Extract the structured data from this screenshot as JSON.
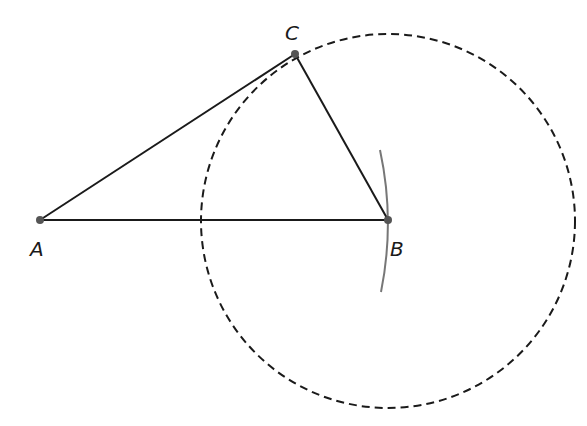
{
  "diagram": {
    "type": "geometric-construction",
    "points": [
      {
        "id": "A",
        "label": "A",
        "x": 40,
        "y": 220,
        "label_x": 30,
        "label_y": 255
      },
      {
        "id": "B",
        "label": "B",
        "x": 388,
        "y": 220,
        "label_x": 390,
        "label_y": 255
      },
      {
        "id": "C",
        "label": "C",
        "x": 295,
        "y": 54,
        "label_x": 285,
        "label_y": 40
      }
    ],
    "segments": [
      {
        "from": "A",
        "to": "B"
      },
      {
        "from": "A",
        "to": "C"
      },
      {
        "from": "B",
        "to": "C"
      }
    ],
    "circle": {
      "center": "B",
      "through": "C",
      "cx": 388,
      "cy": 221,
      "r": 187,
      "style": "dashed"
    },
    "arc": {
      "center": "A",
      "radius": 348,
      "style": "solid-gray",
      "from_y": 150,
      "to_y": 292
    },
    "colors": {
      "line": "#1a1a1a",
      "arc": "#777777",
      "point": "#555555"
    }
  }
}
